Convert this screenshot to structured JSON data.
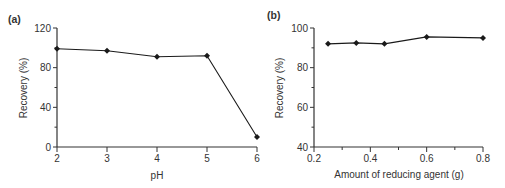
{
  "chart_data": [
    {
      "panel": "(a)",
      "type": "line",
      "title": "",
      "xlabel": "pH",
      "ylabel": "Recovery (%)",
      "x": [
        2,
        3,
        4,
        5,
        6
      ],
      "values": [
        99,
        97,
        91,
        92,
        10
      ],
      "xlim": [
        2,
        6
      ],
      "ylim": [
        0,
        120
      ],
      "xticks": [
        "2",
        "3",
        "4",
        "5",
        "6"
      ],
      "yticks": [
        "0",
        "40",
        "80",
        "120"
      ],
      "grid": false,
      "legend": null
    },
    {
      "panel": "(b)",
      "type": "line",
      "title": "",
      "xlabel": "Amount of reducing agent (g)",
      "ylabel": "Recovery (%)",
      "x": [
        0.25,
        0.35,
        0.45,
        0.6,
        0.8
      ],
      "values": [
        92,
        92.5,
        92,
        95.5,
        95
      ],
      "xlim": [
        0.2,
        0.8
      ],
      "ylim": [
        40,
        100
      ],
      "xticks": [
        "0.2",
        "0.4",
        "0.6",
        "0.8"
      ],
      "yticks": [
        "40",
        "60",
        "80",
        "100"
      ],
      "grid": false,
      "legend": null
    }
  ],
  "colors": {
    "line": "#1a1a1a",
    "axis": "#333333",
    "text": "#333333"
  }
}
